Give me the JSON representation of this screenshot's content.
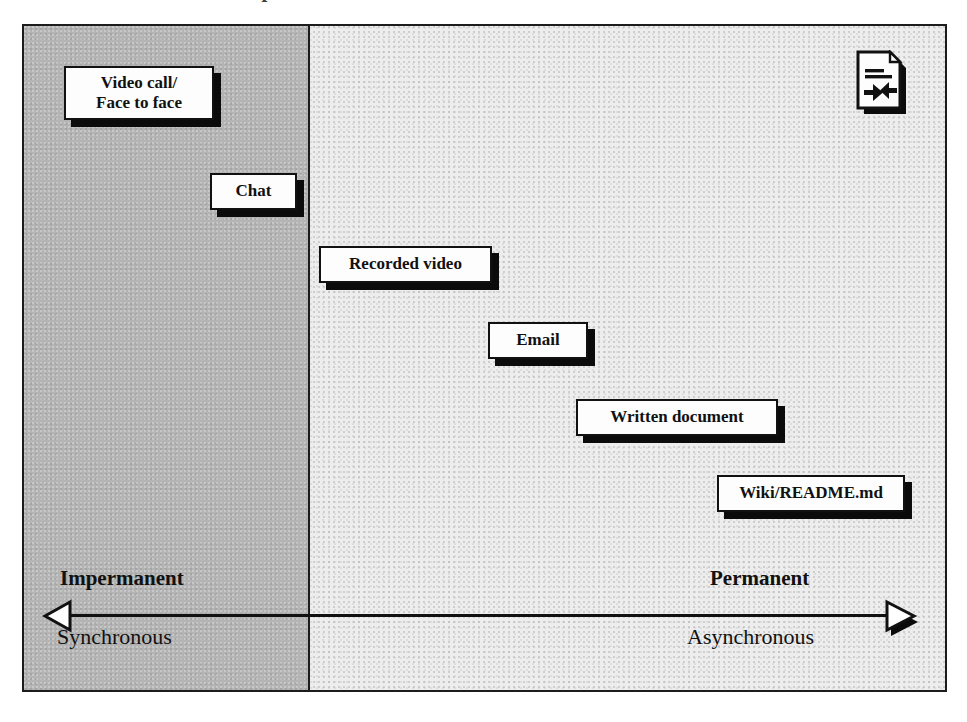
{
  "diagram": {
    "title_cropped": "Communication spectrum",
    "zones": {
      "left_label": "Impermanent / Synchronous zone",
      "right_label": "Permanent / Asynchronous zone"
    },
    "colors": {
      "zone_left_fill": "#b4b4b4",
      "zone_right_fill": "#ededed",
      "frame_border": "#1c1c1c",
      "node_fill": "#fdfdfd",
      "node_border": "#111111",
      "node_shadow": "#0b0b0b",
      "axis": "#111111"
    },
    "nodes": [
      {
        "id": "video-call",
        "label": "Video call/\nFace to face"
      },
      {
        "id": "chat",
        "label": "Chat"
      },
      {
        "id": "recorded-video",
        "label": "Recorded video"
      },
      {
        "id": "email",
        "label": "Email"
      },
      {
        "id": "written-document",
        "label": "Written document"
      },
      {
        "id": "wiki-readme",
        "label": "Wiki/README.md"
      }
    ],
    "axis": {
      "left_top_caption": "Impermanent",
      "left_bottom_caption": "Synchronous",
      "right_top_caption": "Permanent",
      "right_bottom_caption": "Asynchronous",
      "left_arrow_icon": "left-arrow-head-icon",
      "right_arrow_icon": "right-arrow-head-icon"
    },
    "icon": {
      "name": "document-merge-icon",
      "description": "Page with folded corner, two text rules and two converging arrows"
    }
  }
}
